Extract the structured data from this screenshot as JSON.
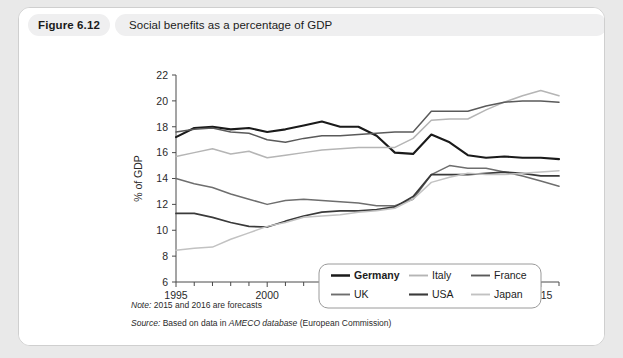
{
  "figure": {
    "number_label": "Figure 6.12",
    "title": "Social benefits as a percentage of GDP"
  },
  "footnotes": {
    "note_lead": "Note:",
    "note_text": " 2015 and 2016 are forecasts",
    "source_lead": "Source:",
    "source_pre": " Based on data in ",
    "source_italic": "AMECO database",
    "source_post": " (European Commission)"
  },
  "chart_data": {
    "type": "line",
    "title": "Social benefits as a percentage of GDP",
    "xlabel": "",
    "ylabel": "% of GDP",
    "xlim": [
      1995,
      2016
    ],
    "ylim": [
      6,
      22
    ],
    "ytick_step": 2,
    "yticks": [
      6,
      8,
      10,
      12,
      14,
      16,
      18,
      20,
      22
    ],
    "xticks_major": [
      1995,
      2000,
      2005,
      2010,
      2015
    ],
    "xticks_minor_every": 1,
    "grid": false,
    "legend_position": "inside-lower-right",
    "x": [
      1995,
      1996,
      1997,
      1998,
      1999,
      2000,
      2001,
      2002,
      2003,
      2004,
      2005,
      2006,
      2007,
      2008,
      2009,
      2010,
      2011,
      2012,
      2013,
      2014,
      2015,
      2016
    ],
    "series": [
      {
        "name": "Germany",
        "color": "#1a1a1a",
        "width": 2.1,
        "values": [
          17.2,
          17.9,
          18.0,
          17.8,
          17.9,
          17.6,
          17.8,
          18.1,
          18.4,
          18.0,
          18.0,
          17.3,
          16.0,
          15.9,
          17.4,
          16.8,
          15.8,
          15.6,
          15.7,
          15.6,
          15.6,
          15.5
        ]
      },
      {
        "name": "Italy",
        "color": "#b5b5b5",
        "width": 1.5,
        "values": [
          15.7,
          16.0,
          16.3,
          15.9,
          16.1,
          15.6,
          15.8,
          16.0,
          16.2,
          16.3,
          16.4,
          16.4,
          16.4,
          17.1,
          18.5,
          18.6,
          18.6,
          19.3,
          19.9,
          20.4,
          20.8,
          20.4
        ]
      },
      {
        "name": "France",
        "color": "#5a5a5a",
        "width": 1.5,
        "values": [
          17.6,
          17.8,
          17.9,
          17.6,
          17.5,
          17.0,
          16.8,
          17.1,
          17.3,
          17.3,
          17.4,
          17.5,
          17.6,
          17.6,
          19.2,
          19.2,
          19.2,
          19.6,
          19.9,
          20.0,
          20.0,
          19.9
        ]
      },
      {
        "name": "UK",
        "color": "#6e6e6e",
        "width": 1.5,
        "values": [
          14.0,
          13.6,
          13.3,
          12.8,
          12.4,
          12.0,
          12.3,
          12.4,
          12.3,
          12.2,
          12.1,
          11.9,
          11.9,
          12.4,
          14.3,
          15.0,
          14.8,
          14.8,
          14.5,
          14.2,
          13.8,
          13.4
        ]
      },
      {
        "name": "USA",
        "color": "#3a3a3a",
        "width": 1.7,
        "values": [
          11.3,
          11.3,
          11.0,
          10.6,
          10.3,
          10.25,
          10.7,
          11.1,
          11.4,
          11.5,
          11.5,
          11.6,
          11.8,
          12.6,
          14.3,
          14.3,
          14.3,
          14.4,
          14.5,
          14.4,
          14.2,
          14.2
        ]
      },
      {
        "name": "Japan",
        "color": "#c2c2c2",
        "width": 1.5,
        "values": [
          8.45,
          8.6,
          8.7,
          9.3,
          9.8,
          10.3,
          10.6,
          11.0,
          11.1,
          11.2,
          11.4,
          11.5,
          11.7,
          12.4,
          13.7,
          14.1,
          14.4,
          14.3,
          14.3,
          14.4,
          14.5,
          14.6
        ]
      }
    ],
    "legend_rows": [
      [
        "Germany",
        "Italy",
        "France"
      ],
      [
        "UK",
        "USA",
        "Japan"
      ]
    ]
  }
}
